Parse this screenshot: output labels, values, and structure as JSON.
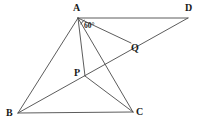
{
  "figure": {
    "type": "geometry-diagram",
    "width": 202,
    "height": 127,
    "background_color": "#ffffff",
    "stroke_color": "#4a4a4a",
    "stroke_width": 0.9,
    "label_color": "#1a1a1a"
  },
  "points": [
    {
      "id": "A",
      "label": "A",
      "x": 78,
      "y": 18,
      "label_x": 73,
      "label_y": 3
    },
    {
      "id": "B",
      "label": "B",
      "x": 18,
      "y": 113,
      "label_x": 6,
      "label_y": 108
    },
    {
      "id": "C",
      "label": "C",
      "x": 133,
      "y": 112,
      "label_x": 136,
      "label_y": 107
    },
    {
      "id": "D",
      "label": "D",
      "x": 188,
      "y": 18,
      "label_x": 185,
      "label_y": 3
    },
    {
      "id": "P",
      "label": "P",
      "x": 85,
      "y": 76,
      "label_x": 74,
      "label_y": 68
    },
    {
      "id": "Q",
      "label": "Q",
      "x": 131,
      "y": 43,
      "label_x": 131,
      "label_y": 43
    }
  ],
  "segments": [
    {
      "id": "AD",
      "from": "A",
      "to": "D",
      "name": "segment-a-d"
    },
    {
      "id": "AB",
      "from": "A",
      "to": "B",
      "name": "segment-a-b"
    },
    {
      "id": "AC",
      "from": "A",
      "to": "C",
      "name": "segment-a-c"
    },
    {
      "id": "AP",
      "from": "A",
      "to": "P",
      "name": "segment-a-p"
    },
    {
      "id": "AQ",
      "from": "A",
      "to": "Q",
      "name": "segment-a-q"
    },
    {
      "id": "BC",
      "from": "B",
      "to": "C",
      "name": "segment-b-c"
    },
    {
      "id": "BD",
      "from": "B",
      "to": "D",
      "name": "segment-b-d-through-p-q"
    },
    {
      "id": "PC",
      "from": "P",
      "to": "C",
      "name": "segment-p-c"
    }
  ],
  "angles": [
    {
      "id": "angle-at-A",
      "label": "60°",
      "vertex": "A",
      "label_x": 84,
      "label_y": 22
    }
  ]
}
